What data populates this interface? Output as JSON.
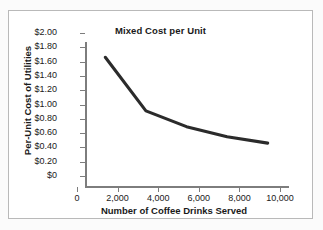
{
  "chart_data": {
    "type": "line",
    "title": "Mixed Cost per Unit",
    "xlabel": "Number of Coffee Drinks Served",
    "ylabel": "Per-Unit Cost of Utilities",
    "xlim": [
      0,
      10000
    ],
    "ylim": [
      0,
      2.0
    ],
    "grid": false,
    "legend": null,
    "x": [
      1000,
      3000,
      5000,
      7000,
      9000
    ],
    "values": [
      1.8,
      1.05,
      0.83,
      0.69,
      0.6
    ],
    "series": [
      {
        "name": "Per-Unit Cost of Utilities",
        "color": "#2b2b2b",
        "points": [
          {
            "x": 1000,
            "y": 1.8
          },
          {
            "x": 3000,
            "y": 1.05
          },
          {
            "x": 5000,
            "y": 0.83
          },
          {
            "x": 7000,
            "y": 0.69
          },
          {
            "x": 9000,
            "y": 0.6
          }
        ]
      }
    ],
    "y_ticks": [
      {
        "value": 2.0,
        "label": "$2.00"
      },
      {
        "value": 1.8,
        "label": "$1.80"
      },
      {
        "value": 1.6,
        "label": "$1.60"
      },
      {
        "value": 1.4,
        "label": "$1.40"
      },
      {
        "value": 1.2,
        "label": "$1.20"
      },
      {
        "value": 1.0,
        "label": "$1.00"
      },
      {
        "value": 0.8,
        "label": "$0.80"
      },
      {
        "value": 0.6,
        "label": "$0.60"
      },
      {
        "value": 0.4,
        "label": "$0.40"
      },
      {
        "value": 0.2,
        "label": "$0.20"
      },
      {
        "value": 0.0,
        "label": "$0"
      }
    ],
    "x_ticks": [
      {
        "value": 0,
        "label": "0"
      },
      {
        "value": 2000,
        "label": "2,000"
      },
      {
        "value": 4000,
        "label": "4,000"
      },
      {
        "value": 6000,
        "label": "6,000"
      },
      {
        "value": 8000,
        "label": "8,000"
      },
      {
        "value": 10000,
        "label": "10,000"
      }
    ],
    "colors": {
      "line": "#2b2b2b",
      "axis": "#7d7d7d",
      "text": "#1a1a1a",
      "border": "#b9b9b9",
      "background": "#ffffff"
    }
  }
}
